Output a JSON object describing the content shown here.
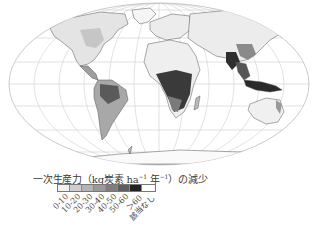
{
  "map": {
    "projection": "Mollweide-like world projection",
    "graticule": true,
    "colors": {
      "graticule": "#c8c8c8",
      "coast": "#555555",
      "land_light": "#e2e2e2",
      "land_mid": "#9a9a9a",
      "land_dark": "#333333"
    }
  },
  "legend": {
    "title_main": "一次生産力（kg炭素 ha",
    "title_sup1": "−1",
    "title_mid": " 年",
    "title_sup2": "−1",
    "title_end": "）の減少",
    "classes": [
      {
        "label": "0-10",
        "color": "#f2f2f2"
      },
      {
        "label": "10-20",
        "color": "#cfcfcf"
      },
      {
        "label": "20-30",
        "color": "#b4b4b4"
      },
      {
        "label": "30-40",
        "color": "#9a9a9a"
      },
      {
        "label": "40-50",
        "color": "#7e7e7e"
      },
      {
        "label": "50-60",
        "color": "#5e5e5e"
      },
      {
        "label": "＞60",
        "color": "#222222"
      },
      {
        "label": "該当なし",
        "color": "#ffffff"
      }
    ]
  }
}
